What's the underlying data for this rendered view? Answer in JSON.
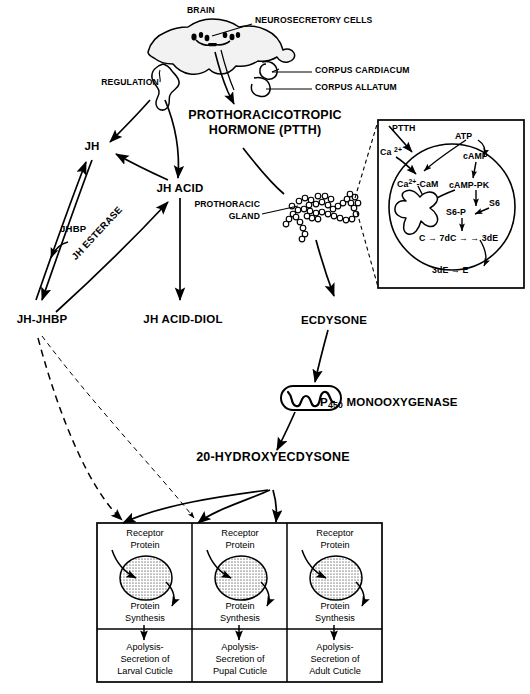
{
  "figure": {
    "ink_color": "#000000",
    "background_color": "#ffffff",
    "organ_fill": "#f2f2f2",
    "nucleus_fill": "#c9c9c9"
  },
  "anatomy": {
    "brain_label": "BRAIN",
    "neurosecretory_label": "NEUROSECRETORY CELLS",
    "corpus_cardiacum_label": "CORPUS CARDIACUM",
    "corpus_allatum_label": "CORPUS ALLATUM",
    "regulation_label": "REGULATION",
    "prothoracic_gland_label_line1": "PROTHORACIC",
    "prothoracic_gland_label_line2": "GLAND"
  },
  "pathway": {
    "ptth_line1": "PROTHORACICOTROPIC",
    "ptth_line2": "HORMONE (PTTH)",
    "jh": "JH",
    "jh_acid": "JH ACID",
    "jh_acid_diol": "JH ACID-DIOL",
    "jh_jhbp": "JH-JHBP",
    "jhbp": "JHBP",
    "jh_esterase": "JH ESTERASE",
    "ecdysone": "ECDYSONE",
    "p450_prefix": "P",
    "p450_sub": "450",
    "p450_suffix": " MONOOXYGENASE",
    "hydroxyecdysone": "20-HYDROXYECDYSONE"
  },
  "inset": {
    "ptth": "PTTH",
    "calcium_outside_main": "Ca ",
    "calcium_outside_sup": "2+",
    "calcium_cam_main": "Ca",
    "calcium_cam_sup": "2+",
    "calcium_cam_tail": "-CaM",
    "atp": "ATP",
    "camp": "cAMP",
    "camp_pk": "cAMP-PK",
    "s6": "S6",
    "s6_p": "S6-P",
    "c_7dc_3de": "C → 7dC → → 3dE",
    "3de_to_e": "3dE → E"
  },
  "receptor_columns": [
    {
      "id": "larval",
      "receptor_line1": "Receptor",
      "receptor_line2": "Protein",
      "synthesis_line1": "Protein",
      "synthesis_line2": "Synthesis",
      "outcome_line1": "Apolysis-",
      "outcome_line2": "Secretion of",
      "outcome_line3": "Larval Cuticle"
    },
    {
      "id": "pupal",
      "receptor_line1": "Receptor",
      "receptor_line2": "Protein",
      "synthesis_line1": "Protein",
      "synthesis_line2": "Synthesis",
      "outcome_line1": "Apolysis-",
      "outcome_line2": "Secretion of",
      "outcome_line3": "Pupal Cuticle"
    },
    {
      "id": "adult",
      "receptor_line1": "Receptor",
      "receptor_line2": "Protein",
      "synthesis_line1": "Protein",
      "synthesis_line2": "Synthesis",
      "outcome_line1": "Apolysis-",
      "outcome_line2": "Secretion of",
      "outcome_line3": "Adult Cuticle"
    }
  ]
}
